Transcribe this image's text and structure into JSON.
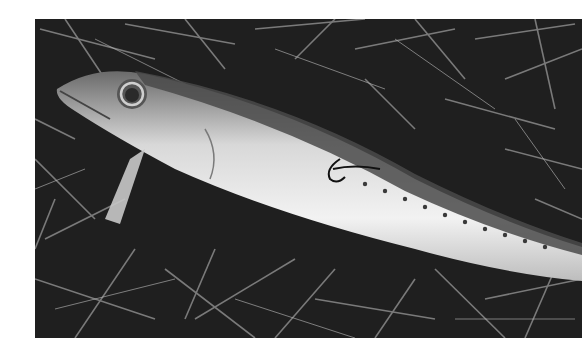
{
  "image": {
    "kind": "photograph",
    "color_mode": "grayscale",
    "subject": "mackerel lying on grass with fishing hook",
    "elements": [
      "fish",
      "grass",
      "fishing-hook",
      "eye",
      "fin"
    ]
  },
  "colors": {
    "background": "#ffffff",
    "grass_dark": "#1b1b1b",
    "grass_light": "#9a9a9a",
    "fish_belly": "#e8e8e8",
    "fish_back": "#5a5a5a"
  }
}
